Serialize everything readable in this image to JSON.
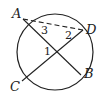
{
  "diagram": {
    "type": "circle-geometry",
    "circle": {
      "cx": 55,
      "cy": 52,
      "r": 38
    },
    "points": {
      "A": {
        "label": "A",
        "x": 23,
        "y": 19
      },
      "D": {
        "label": "D",
        "x": 83,
        "y": 30
      },
      "B": {
        "label": "B",
        "x": 81,
        "y": 75
      },
      "C": {
        "label": "C",
        "x": 22,
        "y": 81
      }
    },
    "chords": [
      {
        "from": "A",
        "to": "B",
        "style": "solid"
      },
      {
        "from": "C",
        "to": "D",
        "style": "solid"
      },
      {
        "from": "A",
        "to": "D",
        "style": "dashed"
      }
    ],
    "angle_labels": [
      {
        "label": "1",
        "x": 44,
        "y": 55
      },
      {
        "label": "2",
        "x": 65,
        "y": 39
      },
      {
        "label": "3",
        "x": 40,
        "y": 33
      }
    ],
    "stroke_color": "#222222"
  }
}
